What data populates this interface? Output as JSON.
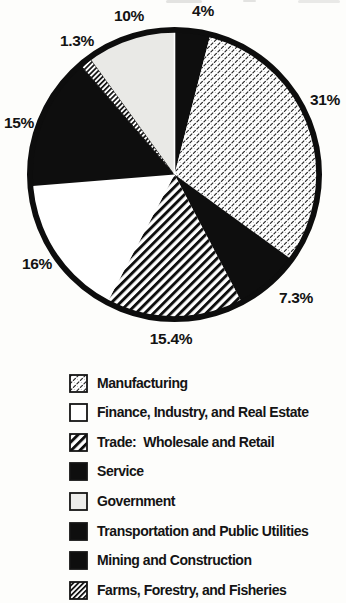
{
  "chart_data": {
    "type": "pie",
    "title": "",
    "unit": "percent",
    "direction": "clockwise",
    "start_angle": "12-oclock",
    "total": 100,
    "slices": [
      {
        "id": "mining",
        "legend_label": "Mining and Construction",
        "value": 4,
        "display_label": "4%",
        "pattern": "solid-black"
      },
      {
        "id": "manufacturing",
        "legend_label": "Manufacturing",
        "value": 31,
        "display_label": "31%",
        "pattern": "dash-texture"
      },
      {
        "id": "service",
        "legend_label": "Service",
        "value": 7.3,
        "display_label": "7.3%",
        "pattern": "solid-black"
      },
      {
        "id": "trade",
        "legend_label": "Trade:  Wholesale and Retail",
        "value": 15.4,
        "display_label": "15.4%",
        "pattern": "bold-diagonal-stripes"
      },
      {
        "id": "finance",
        "legend_label": "Finance, Industry, and Real Estate",
        "value": 16,
        "display_label": "16%",
        "pattern": "white"
      },
      {
        "id": "transportation",
        "legend_label": "Transportation and Public Utilities",
        "value": 15,
        "display_label": "15%",
        "pattern": "solid-black"
      },
      {
        "id": "farms",
        "legend_label": "Farms, Forestry, and Fisheries",
        "value": 1.3,
        "display_label": "1.3%",
        "pattern": "fine-diagonal-stripes"
      },
      {
        "id": "government",
        "legend_label": "Government",
        "value": 10,
        "display_label": "10%",
        "pattern": "light-gray"
      }
    ],
    "legend": [
      {
        "slice_id": "manufacturing",
        "label": "Manufacturing",
        "pattern": "dash-texture"
      },
      {
        "slice_id": "finance",
        "label": "Finance, Industry, and Real Estate",
        "pattern": "white"
      },
      {
        "slice_id": "trade",
        "label": "Trade:  Wholesale and Retail",
        "pattern": "bold-diagonal-stripes"
      },
      {
        "slice_id": "service",
        "label": "Service",
        "pattern": "solid-black"
      },
      {
        "slice_id": "government",
        "label": "Government",
        "pattern": "light-gray"
      },
      {
        "slice_id": "transportation",
        "label": "Transportation and Public Utilities",
        "pattern": "solid-black"
      },
      {
        "slice_id": "mining",
        "label": "Mining and Construction",
        "pattern": "solid-black"
      },
      {
        "slice_id": "farms",
        "label": "Farms, Forestry, and Fisheries",
        "pattern": "fine-diagonal-stripes"
      }
    ],
    "layout_hints": {
      "legend_position": "below",
      "grid": false
    },
    "colors": {
      "ink": "#0e0e0e",
      "white_fill": "#ffffff",
      "light_gray_fill": "#e9e9e6",
      "background": "#fdfdfb"
    }
  }
}
